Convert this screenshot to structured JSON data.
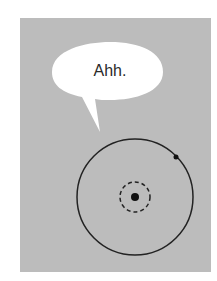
{
  "speech_bubble": {
    "text": "Ahh."
  },
  "colors": {
    "panel": "#bcbcbc",
    "bubble": "#ffffff",
    "stroke": "#222222"
  },
  "diagram": {
    "outer_circle": {
      "cx": 135,
      "cy": 197,
      "r": 58
    },
    "inner_dashed_circle": {
      "cx": 135,
      "cy": 197,
      "r": 15
    },
    "center_dot": {
      "cx": 135,
      "cy": 197,
      "r": 4
    },
    "orbit_dot": {
      "cx": 176,
      "cy": 157,
      "r": 2.5
    }
  }
}
